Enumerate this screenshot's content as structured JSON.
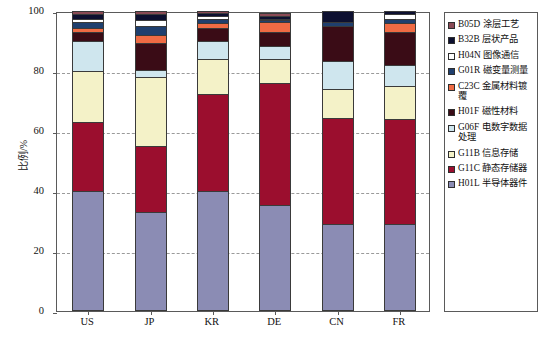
{
  "chart_data": {
    "type": "bar",
    "subtype": "stacked-percentage",
    "title": "",
    "xlabel": "",
    "ylabel": "比例/%",
    "ylim": [
      0,
      100
    ],
    "yticks": [
      0,
      20,
      40,
      60,
      80,
      100
    ],
    "grid": true,
    "legend_position": "right",
    "categories": [
      "US",
      "JP",
      "KR",
      "DE",
      "CN",
      "FR"
    ],
    "series": [
      {
        "name": "H01L 半导体器件",
        "code": "H01L",
        "color": "#8b8cb4",
        "values": [
          40.0,
          33.0,
          40.0,
          35.5,
          29.0,
          29.0
        ]
      },
      {
        "name": "G11C 静态存储器",
        "code": "G11C",
        "color": "#9b0e2e",
        "values": [
          23.0,
          22.0,
          32.5,
          40.5,
          35.5,
          35.0
        ]
      },
      {
        "name": "G11B 信息存储",
        "code": "G11B",
        "color": "#f4f2c8",
        "values": [
          17.0,
          23.0,
          11.5,
          8.0,
          9.5,
          11.0
        ]
      },
      {
        "name": "G06F 电数字数据处理",
        "code": "G06F",
        "color": "#cfe6ee",
        "values": [
          10.0,
          2.5,
          6.0,
          4.5,
          9.5,
          7.0
        ]
      },
      {
        "name": "H01F 磁性材料",
        "code": "H01F",
        "color": "#3a0c16",
        "values": [
          3.0,
          9.0,
          4.5,
          4.5,
          11.5,
          11.0
        ]
      },
      {
        "name": "C23C 金属材料镀覆",
        "code": "C23C",
        "color": "#ef6b44",
        "values": [
          1.5,
          2.5,
          1.5,
          3.5,
          0.0,
          3.0
        ]
      },
      {
        "name": "G01R 磁变量测量",
        "code": "G01R",
        "color": "#1f3f6e",
        "values": [
          2.0,
          3.0,
          1.5,
          0.5,
          1.5,
          1.5
        ]
      },
      {
        "name": "H04N 图像通信",
        "code": "H04N",
        "color": "#ffffff",
        "values": [
          1.0,
          2.0,
          1.0,
          0.5,
          0.0,
          1.5
        ]
      },
      {
        "name": "B32B 层状产品",
        "code": "B32B",
        "color": "#0d1030",
        "values": [
          1.5,
          2.0,
          1.0,
          1.0,
          3.5,
          1.0
        ]
      },
      {
        "name": "B05D 涂层工艺",
        "code": "B05D",
        "color": "#8a4a55",
        "values": [
          1.0,
          1.0,
          0.5,
          1.0,
          0.0,
          0.0
        ]
      }
    ]
  },
  "axes": {
    "y_title": "比例/%",
    "y_ticks": [
      "100",
      "80",
      "60",
      "40",
      "20",
      "0"
    ],
    "x_ticks": [
      "US",
      "JP",
      "KR",
      "DE",
      "CN",
      "FR"
    ]
  },
  "legend": {
    "items": [
      {
        "label": "B05D 涂层工艺",
        "color": "#8a4a55"
      },
      {
        "label": "B32B 层状产品",
        "color": "#0d1030"
      },
      {
        "label": "H04N 图像通信",
        "color": "#ffffff"
      },
      {
        "label": "G01R 磁变量测量",
        "color": "#1f3f6e"
      },
      {
        "label": "C23C 金属材料镀覆",
        "color": "#ef6b44"
      },
      {
        "label": "H01F 磁性材料",
        "color": "#3a0c16"
      },
      {
        "label": "G06F 电数字数据处理",
        "color": "#cfe6ee"
      },
      {
        "label": "G11B 信息存储",
        "color": "#f4f2c8"
      },
      {
        "label": "G11C 静态存储器",
        "color": "#9b0e2e"
      },
      {
        "label": "H01L 半导体器件",
        "color": "#8b8cb4"
      }
    ]
  }
}
